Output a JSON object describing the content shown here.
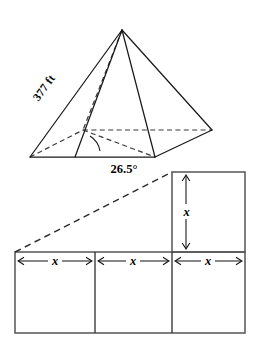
{
  "figure": {
    "colors": {
      "stroke": "#1a1a1a",
      "hidden_stroke": "#3a3a3a",
      "net_stroke": "#555555",
      "background": "#ffffff"
    },
    "pyramid": {
      "name": "square-pyramid",
      "slant_label": "377 ft",
      "angle_label": "26.5°",
      "apex": {
        "x": 122,
        "y": 30
      },
      "base_front_left": {
        "x": 30,
        "y": 157
      },
      "base_front_right": {
        "x": 155,
        "y": 157
      },
      "base_back_right": {
        "x": 212,
        "y": 130
      },
      "base_back_left": {
        "x": 83,
        "y": 130
      },
      "slant_label_rotation": -54
    },
    "net": {
      "name": "rectangle-net",
      "left": 15,
      "right": 245,
      "bottom_row_top": 252,
      "bottom_row_bottom": 333,
      "divider_1_x": 95,
      "divider_2_x": 172,
      "upper_square_top": 172,
      "width_labels": [
        "x",
        "x",
        "x"
      ],
      "height_label": "x",
      "dashed_diagonal": {
        "from": {
          "x": 15,
          "y": 252
        },
        "to": {
          "x": 172,
          "y": 172
        }
      }
    }
  }
}
